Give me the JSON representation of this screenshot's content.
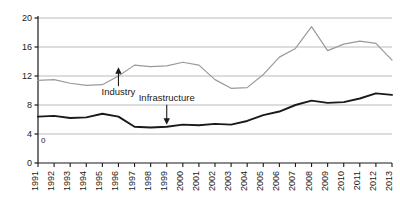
{
  "chart_data": {
    "type": "line",
    "title": "",
    "xlabel": "",
    "ylabel": "",
    "x": [
      1991,
      1992,
      1993,
      1994,
      1995,
      1996,
      1997,
      1998,
      1999,
      2000,
      2001,
      2002,
      2003,
      2004,
      2005,
      2006,
      2007,
      2008,
      2009,
      2010,
      2011,
      2012,
      2013
    ],
    "xtick_labels": [
      "1991",
      "1992",
      "1993",
      "1994",
      "1995",
      "1996",
      "1997",
      "1998",
      "1999",
      "2000",
      "2001",
      "2002",
      "2003",
      "2004",
      "2005",
      "2006",
      "2007",
      "2008",
      "2009",
      "2010",
      "2011",
      "2012",
      "2013"
    ],
    "ytick_labels": [
      "0",
      "4",
      "8",
      "12",
      "16",
      "20"
    ],
    "yticks": [
      0,
      4,
      8,
      12,
      16,
      20
    ],
    "ylim": [
      0,
      20
    ],
    "grid": true,
    "grid_axis": "y",
    "legend": "annotations",
    "series": [
      {
        "name": "Industry",
        "color": "#9a9a9a",
        "values": [
          11.4,
          11.5,
          11.0,
          10.7,
          10.8,
          12.0,
          13.5,
          13.3,
          13.4,
          13.9,
          13.5,
          11.5,
          10.3,
          10.4,
          12.2,
          14.6,
          15.8,
          18.8,
          15.5,
          16.4,
          16.8,
          16.5,
          14.2
        ]
      },
      {
        "name": "Infrastructure",
        "color": "#1a1a1a",
        "values": [
          6.4,
          6.5,
          6.2,
          6.3,
          6.8,
          6.4,
          5.0,
          4.9,
          5.0,
          5.3,
          5.2,
          5.4,
          5.3,
          5.8,
          6.6,
          7.1,
          8.0,
          8.6,
          8.3,
          8.4,
          8.9,
          9.6,
          9.4
        ]
      }
    ],
    "annotations": [
      {
        "text": "Industry",
        "series": "Industry",
        "x": 1996,
        "y": 13.5,
        "arrow": "up"
      },
      {
        "text": "Infrastructure",
        "series": "Infrastructure",
        "x": 1999,
        "y": 5.0,
        "arrow": "down"
      }
    ],
    "zero_marker": "0"
  },
  "colors": {
    "industry_line": "#9a9a9a",
    "infrastructure_line": "#1a1a1a",
    "gridline": "#b3b3b3",
    "axis": "#1a1a1a",
    "background": "#ffffff"
  }
}
